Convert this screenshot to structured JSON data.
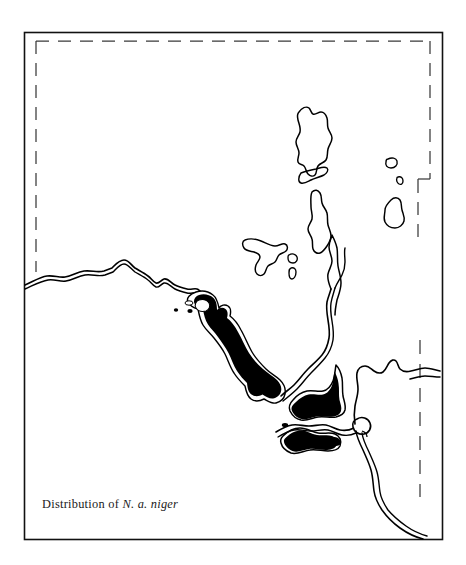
{
  "figure": {
    "type": "species-distribution-map",
    "caption_prefix": "Distribution of ",
    "caption_taxon": "N. a. niger",
    "caption_full": "Distribution of N. a. niger",
    "background_color": "#ffffff",
    "ink_color": "#000000",
    "frame": {
      "name": "map-border-frame",
      "style": "solid-rectangle",
      "stroke_color": "#000000",
      "x": 24,
      "y": 32,
      "width": 419,
      "height": 508
    },
    "graticule": {
      "name": "dashed-boundary",
      "style": "dashed",
      "stroke_color": "#333333",
      "description": "dashed political boundary inset along top, left and right edges with a small step notch on the right side"
    },
    "legend": {
      "shading_label": "solid black fill",
      "shading_meaning": "Distribution of N. a. niger",
      "shading_color": "#000000"
    },
    "features": {
      "coastline_style": "double-line",
      "island_outline_style": "single-line",
      "river_name": "river-channel",
      "filled_range_count": 4,
      "island_count": 7
    }
  }
}
